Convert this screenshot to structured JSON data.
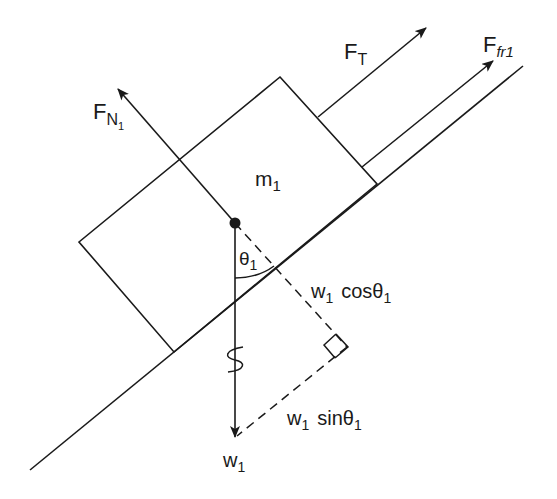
{
  "diagram": {
    "colors": {
      "line": "#1a1a1a",
      "background": "#ffffff"
    },
    "labels": {
      "mass": {
        "base": "m",
        "sub": "1"
      },
      "normal_force": {
        "base": "F",
        "sub": "N",
        "subsub": "1"
      },
      "tension_force": {
        "base": "F",
        "sub": "T"
      },
      "friction_force": {
        "base": "F",
        "sub": "fr1"
      },
      "angle": {
        "base": "θ",
        "sub": "1"
      },
      "weight": {
        "base": "w",
        "sub": "1"
      },
      "weight_cos": {
        "base": "w",
        "sub": "1",
        "func": "cosθ",
        "func_sub": "1"
      },
      "weight_sin": {
        "base": "w",
        "sub": "1",
        "func": "sinθ",
        "func_sub": "1"
      }
    }
  }
}
